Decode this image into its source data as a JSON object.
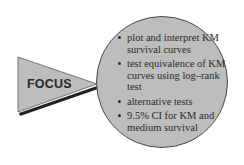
{
  "diagram": {
    "pointer_label": "FOCUS",
    "bullets": [
      {
        "text": "plot and interpret KM survival curves"
      },
      {
        "text": "test equivalence of KM curves using log–rank test"
      },
      {
        "text": "alternative tests"
      },
      {
        "text": "9.5% CI for KM and medium survival"
      }
    ],
    "colors": {
      "shape_fill": "#bdbdbd",
      "shape_stroke": "#4a4a4a",
      "shadow": "#222222",
      "text": "#2b2b2b",
      "background": "#ffffff"
    }
  }
}
